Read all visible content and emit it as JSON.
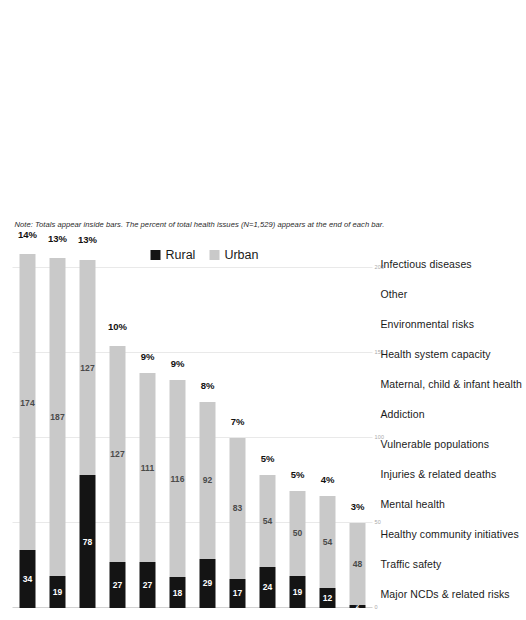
{
  "chart_data": {
    "type": "bar",
    "orientation": "horizontal-stacked",
    "title": "",
    "subtitle": "",
    "xlabel": "",
    "ylabel": "",
    "xlim": [
      0,
      200
    ],
    "xticks": [
      0,
      50,
      100,
      150,
      200
    ],
    "xticklabels": [
      "0",
      "50",
      "100",
      "150",
      "200"
    ],
    "grid": true,
    "legend_position": "bottom",
    "categories": [
      "Major NCDs & related risks",
      "Traffic safety",
      "Healthy community initiatives",
      "Mental health",
      "Injuries & related deaths",
      "Vulnerable populations",
      "Addiction",
      "Maternal, child & infant health",
      "Health system capacity",
      "Environmental risks",
      "Other",
      "Infectious diseases"
    ],
    "series": [
      {
        "name": "Rural",
        "color": "#141414",
        "values": [
          34,
          19,
          78,
          27,
          27,
          18,
          29,
          17,
          24,
          19,
          12,
          2
        ]
      },
      {
        "name": "Urban",
        "color": "#c9c9c9",
        "values": [
          174,
          187,
          127,
          127,
          111,
          116,
          92,
          83,
          54,
          50,
          54,
          48
        ]
      }
    ],
    "end_labels": [
      "14%",
      "13%",
      "13%",
      "10%",
      "9%",
      "9%",
      "8%",
      "7%",
      "5%",
      "5%",
      "4%",
      "3%"
    ],
    "totals": [
      208,
      206,
      205,
      154,
      138,
      134,
      121,
      100,
      78,
      69,
      66,
      50
    ]
  },
  "legend": {
    "items": [
      {
        "label": "Rural",
        "color": "#141414"
      },
      {
        "label": "Urban",
        "color": "#c9c9c9"
      }
    ]
  },
  "note": {
    "text": "Note: Totals appear inside bars. The percent of total health issues (N=1,529) appears at the end of each bar."
  }
}
